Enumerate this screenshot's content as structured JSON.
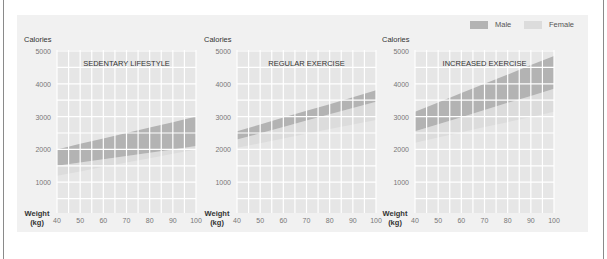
{
  "legend": {
    "male_label": "Male",
    "female_label": "Female",
    "male_color": "#b3b3b3",
    "female_color": "#dcdcdc"
  },
  "colors": {
    "panel_bg": "#f1f1f1",
    "plot_bg": "#e6e6e6",
    "grid": "#ffffff",
    "male": "#b3b3b3",
    "female": "#dcdcdc",
    "text": "#333333",
    "tick_text": "#777777"
  },
  "chart_data": [
    {
      "type": "area",
      "title": "SEDENTARY LIFESTYLE",
      "xlabel": "Weight (kg)",
      "ylabel": "Calories",
      "x": [
        40,
        50,
        60,
        70,
        80,
        90,
        100
      ],
      "x_ticks": [
        "40",
        "50",
        "60",
        "70",
        "80",
        "90",
        "100"
      ],
      "y_ticks": [
        "1000",
        "2000",
        "3000",
        "4000",
        "5000"
      ],
      "ylim": [
        0,
        5000
      ],
      "xlim": [
        40,
        100
      ],
      "grid": true,
      "legend_position": "top-right",
      "series": [
        {
          "name": "Male",
          "low": [
            1500,
            1600,
            1700,
            1800,
            1900,
            2000,
            2100
          ],
          "high": [
            2000,
            2170,
            2330,
            2500,
            2670,
            2830,
            3000
          ]
        },
        {
          "name": "Female",
          "low": [
            1200,
            1330,
            1470,
            1600,
            1730,
            1870,
            2000
          ],
          "high": [
            1500,
            1600,
            1700,
            1800,
            1900,
            2000,
            2100
          ]
        }
      ]
    },
    {
      "type": "area",
      "title": "REGULAR EXERCISE",
      "xlabel": "Weight (kg)",
      "ylabel": "Calories",
      "x": [
        40,
        50,
        60,
        70,
        80,
        90,
        100
      ],
      "x_ticks": [
        "40",
        "50",
        "60",
        "70",
        "80",
        "90",
        "100"
      ],
      "y_ticks": [
        "1000",
        "2000",
        "3000",
        "4000",
        "5000"
      ],
      "ylim": [
        0,
        5000
      ],
      "xlim": [
        40,
        100
      ],
      "grid": true,
      "series": [
        {
          "name": "Male",
          "low": [
            2300,
            2490,
            2680,
            2880,
            3070,
            3260,
            3450
          ],
          "high": [
            2550,
            2760,
            2970,
            3180,
            3380,
            3590,
            3800
          ]
        },
        {
          "name": "Female",
          "low": [
            2050,
            2190,
            2330,
            2480,
            2620,
            2760,
            2900
          ],
          "high": [
            2300,
            2490,
            2680,
            2880,
            3070,
            3260,
            3450
          ]
        }
      ]
    },
    {
      "type": "area",
      "title": "INCREASED EXERCISE",
      "xlabel": "Weight (kg)",
      "ylabel": "Calories",
      "x": [
        40,
        50,
        60,
        70,
        80,
        90,
        100
      ],
      "x_ticks": [
        "40",
        "50",
        "60",
        "70",
        "80",
        "90",
        "100"
      ],
      "y_ticks": [
        "1000",
        "2000",
        "3000",
        "4000",
        "5000"
      ],
      "ylim": [
        0,
        5000
      ],
      "xlim": [
        40,
        100
      ],
      "grid": true,
      "series": [
        {
          "name": "Male",
          "low": [
            2550,
            2770,
            2980,
            3200,
            3420,
            3630,
            3850
          ],
          "high": [
            3150,
            3430,
            3720,
            4000,
            4280,
            4570,
            4850
          ]
        },
        {
          "name": "Female",
          "low": [
            2200,
            2360,
            2520,
            2680,
            2830,
            2990,
            3150
          ],
          "high": [
            2550,
            2770,
            2980,
            3200,
            3420,
            3630,
            3850
          ]
        }
      ]
    }
  ],
  "axis": {
    "y_title": "Calories",
    "x_title_line1": "Weight",
    "x_title_line2": "(kg)"
  }
}
